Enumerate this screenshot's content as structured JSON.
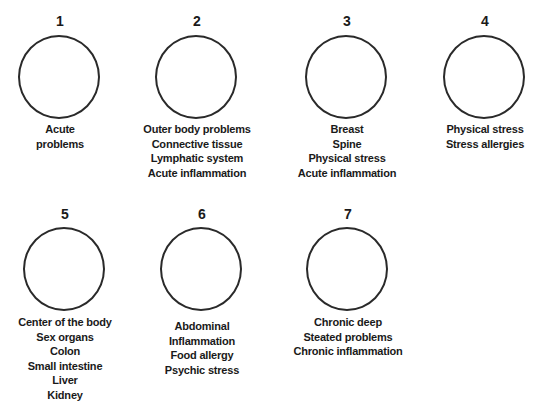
{
  "diagram": {
    "nodes": [
      {
        "number": "1",
        "labels": [
          "Acute",
          "problems"
        ]
      },
      {
        "number": "2",
        "labels": [
          "Outer body problems",
          "Connective tissue",
          "Lymphatic system",
          "Acute inflammation"
        ]
      },
      {
        "number": "3",
        "labels": [
          "Breast",
          "Spine",
          "Physical stress",
          "Acute inflammation"
        ]
      },
      {
        "number": "4",
        "labels": [
          "Physical stress",
          "Stress allergies"
        ]
      },
      {
        "number": "5",
        "labels": [
          "Center of the body",
          "Sex organs",
          "Colon",
          "Small intestine",
          "Liver",
          "Kidney"
        ]
      },
      {
        "number": "6",
        "labels": [
          "Abdominal",
          "Inflammation",
          "Food allergy",
          "Psychic stress"
        ]
      },
      {
        "number": "7",
        "labels": [
          "Chronic deep",
          "Steated problems",
          "Chronic inflammation"
        ]
      }
    ]
  }
}
